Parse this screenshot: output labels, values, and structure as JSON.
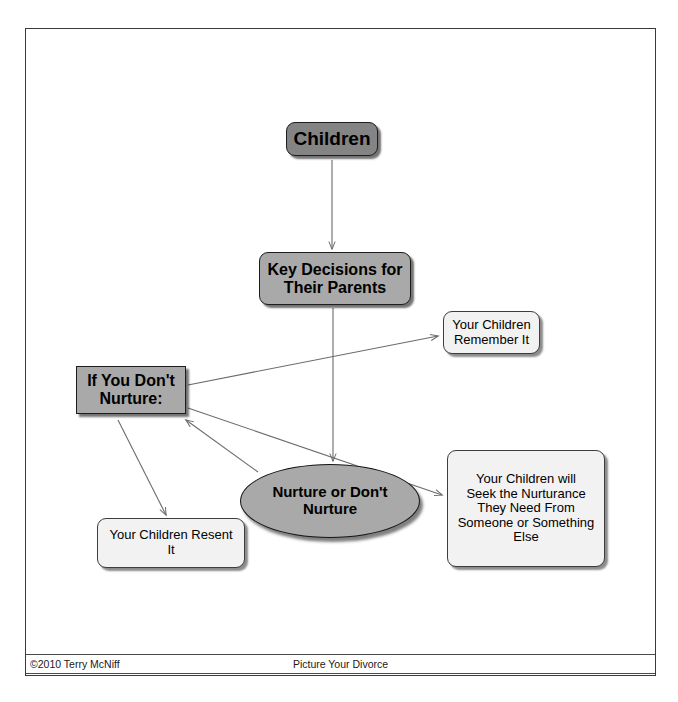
{
  "slide": {
    "title": "Children - Key Decisions for Their Parents",
    "footer": {
      "copyright": "©2010 Terry McNiff",
      "center_label": "Picture Your Divorce"
    }
  },
  "colors": {
    "node_dark_fill": "#848484",
    "node_mid_fill": "#a9a9a9",
    "node_light_fill": "#f2f2f2",
    "ellipse_fill": "#a9a9a9",
    "border_dark": "#1d1d1d",
    "border_light": "#3d3d3d",
    "frame": "#3a3a3a",
    "text": "#000000",
    "connector": "#6b6b6b"
  },
  "diagram": {
    "type": "flowchart",
    "nodes": [
      {
        "id": "children",
        "label": "Children",
        "shape": "rounded-rect",
        "style": "dark"
      },
      {
        "id": "key_decisions",
        "label": "Key Decisions for\nTheir Parents",
        "shape": "rounded-rect",
        "style": "mid"
      },
      {
        "id": "remember",
        "label": "Your Children\nRemember It",
        "shape": "rounded-rect",
        "style": "light"
      },
      {
        "id": "if_dont",
        "label": "If You Don't\nNurture:",
        "shape": "rect",
        "style": "mid"
      },
      {
        "id": "nurture",
        "label": "Nurture or Don't\nNurture",
        "shape": "ellipse",
        "style": "mid"
      },
      {
        "id": "seek",
        "label": "Your Children will\nSeek the Nurturance\nThey Need From\nSomeone or Something\nElse",
        "shape": "rounded-rect",
        "style": "light"
      },
      {
        "id": "resent",
        "label": "Your Children Resent\nIt",
        "shape": "rounded-rect",
        "style": "light"
      }
    ],
    "edges": [
      {
        "from": "children",
        "to": "key_decisions",
        "arrow": "single"
      },
      {
        "from": "key_decisions",
        "to": "nurture",
        "arrow": "single"
      },
      {
        "from": "if_dont",
        "to": "remember",
        "arrow": "single"
      },
      {
        "from": "if_dont",
        "to": "seek",
        "arrow": "single"
      },
      {
        "from": "nurture",
        "to": "if_dont",
        "arrow": "single"
      },
      {
        "from": "if_dont",
        "to": "resent",
        "arrow": "single"
      }
    ]
  }
}
